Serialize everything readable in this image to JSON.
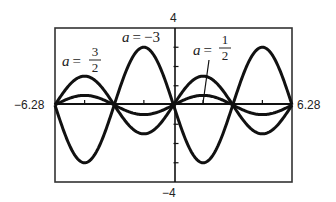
{
  "chart_data": {
    "type": "line",
    "title": "",
    "function": "y = a·sin(x)",
    "xlabel": "",
    "ylabel": "",
    "xlim": [
      -6.28,
      6.28
    ],
    "ylim": [
      -4,
      4
    ],
    "grid": false,
    "legend": "inline labels",
    "x_tick_labels": {
      "min": "−6.28",
      "max": "6.28"
    },
    "y_tick_labels": {
      "max": "4",
      "min": "−4"
    },
    "x_ticks": [
      -4.71,
      -1.57,
      1.57,
      4.71
    ],
    "y_ticks": [
      -3,
      -2,
      -1,
      1,
      2,
      3
    ],
    "series": [
      {
        "name": "a = 3/2",
        "a": 1.5,
        "label": {
          "var": "a",
          "eq": "=",
          "num": "3",
          "den": "2"
        }
      },
      {
        "name": "a = −3",
        "a": -3,
        "label": {
          "var": "a",
          "eq": "=",
          "value": "−3"
        }
      },
      {
        "name": "a = 1/2",
        "a": 0.5,
        "label": {
          "var": "a",
          "eq": "=",
          "num": "1",
          "den": "2"
        }
      }
    ],
    "sample_points": {
      "x": [
        -6.28,
        -4.71,
        -3.14,
        -1.57,
        0,
        1.57,
        3.14,
        4.71,
        6.28
      ],
      "a=3/2": [
        0,
        1.5,
        0,
        -1.5,
        0,
        1.5,
        0,
        -1.5,
        0
      ],
      "a=-3": [
        0,
        -3,
        0,
        3,
        0,
        -3,
        0,
        3,
        0
      ],
      "a=1/2": [
        0,
        0.5,
        0,
        -0.5,
        0,
        0.5,
        0,
        -0.5,
        0
      ]
    }
  },
  "style": {
    "line_color": "#111111",
    "frame_color": "#333333",
    "background": "#ffffff"
  }
}
